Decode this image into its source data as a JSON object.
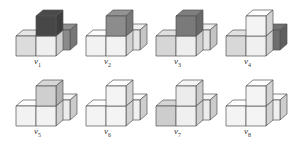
{
  "figure": {
    "panels": [
      {
        "id": "v1",
        "label_main": "v",
        "label_sub": "1",
        "x": 12,
        "y": 4,
        "colors": {
          "top": "#474747",
          "back": "#8a8a8a",
          "left": "#dcdcdc",
          "front": "#efefef"
        }
      },
      {
        "id": "v2",
        "label_main": "v",
        "label_sub": "2",
        "x": 82,
        "y": 4,
        "colors": {
          "top": "#8c8c8c",
          "back": "#e6e6e6",
          "left": "#f2f2f2",
          "front": "#f2f2f2"
        }
      },
      {
        "id": "v3",
        "label_main": "v",
        "label_sub": "3",
        "x": 152,
        "y": 4,
        "colors": {
          "top": "#7a7a7a",
          "back": "#e4e4e4",
          "left": "#d6d6d6",
          "front": "#eeeeee"
        }
      },
      {
        "id": "v4",
        "label_main": "v",
        "label_sub": "4",
        "x": 222,
        "y": 4,
        "colors": {
          "top": "#f4f4f4",
          "back": "#6e6e6e",
          "left": "#d8d8d8",
          "front": "#f0f0f0"
        }
      },
      {
        "id": "v5",
        "label_main": "v",
        "label_sub": "5",
        "x": 12,
        "y": 74,
        "colors": {
          "top": "#cfcfcf",
          "back": "#ececec",
          "left": "#f2f2f2",
          "front": "#f2f2f2"
        }
      },
      {
        "id": "v6",
        "label_main": "v",
        "label_sub": "6",
        "x": 82,
        "y": 74,
        "colors": {
          "top": "#f4f4f4",
          "back": "#f0f0f0",
          "left": "#f4f4f4",
          "front": "#f4f4f4"
        }
      },
      {
        "id": "v7",
        "label_main": "v",
        "label_sub": "7",
        "x": 152,
        "y": 74,
        "colors": {
          "top": "#ececec",
          "back": "#ececec",
          "left": "#cdcdcd",
          "front": "#f0f0f0"
        }
      },
      {
        "id": "v8",
        "label_main": "v",
        "label_sub": "8",
        "x": 222,
        "y": 74,
        "colors": {
          "top": "#f4f4f4",
          "back": "#f0f0f0",
          "left": "#f4f4f4",
          "front": "#f4f4f4"
        }
      }
    ],
    "stroke_color": "#555555"
  }
}
